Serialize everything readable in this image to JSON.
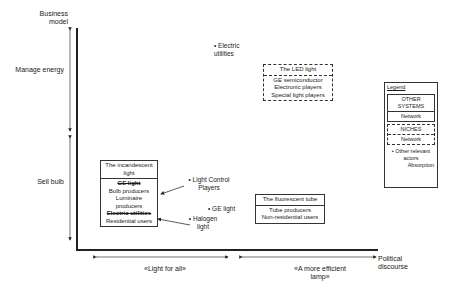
{
  "axes": {
    "y_title": "Business model",
    "x_title": "Political discourse",
    "y_segments": [
      {
        "label": "Manage energy"
      },
      {
        "label": "Sell bulb"
      }
    ],
    "x_segments": [
      {
        "label": "«Light for all»"
      },
      {
        "label": "«A more efficient lamp»"
      }
    ]
  },
  "systems": {
    "incandescent": {
      "title": "The incandescent light",
      "actors": [
        {
          "text": "GE light",
          "struck": true
        },
        {
          "text": "Bulb producers",
          "struck": false
        },
        {
          "text": "Luminaire producers",
          "struck": false
        },
        {
          "text": "Electric utilities",
          "struck": true
        },
        {
          "text": "Residential users",
          "struck": false
        }
      ]
    },
    "fluorescent": {
      "title": "The fluorescent tube",
      "actors": [
        "Tube producers",
        "Non-residential users"
      ]
    },
    "led": {
      "title": "The LED light",
      "actors": [
        "GE semiconductor",
        "Electronic players",
        "Special light players"
      ]
    }
  },
  "other_actors": [
    {
      "label": "Electric utilities"
    },
    {
      "label": "Light Control Players"
    },
    {
      "label": "GE light"
    },
    {
      "label": "Halogen light"
    }
  ],
  "legend": {
    "title": "Legend",
    "other_systems": "OTHER SYSTEMS",
    "network1": "Network",
    "niches": "NICHES",
    "network2": "Network",
    "other_relevant": "• Other relevant actors",
    "absorption": "Absorption"
  }
}
